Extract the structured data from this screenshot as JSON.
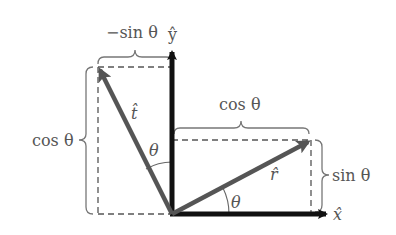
{
  "diagram": {
    "labels": {
      "y_axis_component": "−sin θ",
      "y_hat": "ŷ",
      "x_hat": "x̂",
      "t_hat": "t̂",
      "r_hat": "r̂",
      "left_cos": "cos θ",
      "top_cos": "cos θ",
      "right_sin": "sin θ",
      "theta_upper": "θ",
      "theta_lower": "θ"
    },
    "colors": {
      "axes": "#111111",
      "vectors": "#555555",
      "text": "#555555",
      "dashes": "#555555"
    }
  }
}
